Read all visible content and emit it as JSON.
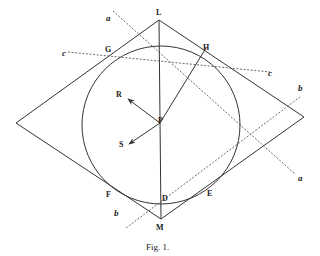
{
  "figure": {
    "caption": "Fig. 1.",
    "points": {
      "L": "L",
      "M": "M",
      "G": "G",
      "H": "H",
      "P": "P",
      "R": "R",
      "S": "S",
      "D": "D",
      "E": "E",
      "F": "F"
    },
    "lines": {
      "a_top": "a",
      "a_bottom": "a",
      "b_top": "b",
      "b_bottom": "b",
      "c_left": "c",
      "c_right": "c"
    }
  },
  "geometry": {
    "rhombus": [
      [
        159,
        20
      ],
      [
        304,
        117
      ],
      [
        161,
        219
      ],
      [
        16,
        123
      ]
    ],
    "circle": {
      "cx": 161,
      "cy": 125,
      "r": 79
    },
    "center_P": [
      160,
      123
    ]
  }
}
